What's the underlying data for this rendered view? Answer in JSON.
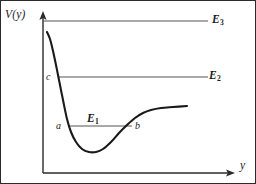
{
  "figure": {
    "axes": {
      "vertical_label": "V(y)",
      "horizontal_label": "y"
    },
    "energy_levels": [
      {
        "name": "E1",
        "label": "E",
        "subscript": "1"
      },
      {
        "name": "E2",
        "label": "E",
        "subscript": "2"
      },
      {
        "name": "E3",
        "label": "E",
        "subscript": "3"
      }
    ],
    "points": [
      {
        "name": "a",
        "label": "a"
      },
      {
        "name": "b",
        "label": "b"
      },
      {
        "name": "c",
        "label": "c"
      }
    ],
    "colors": {
      "curve": "#1a1a1a",
      "axis": "#2b2b2b",
      "level_line": "#555555",
      "frame": "#2b2b2b",
      "background": "#ffffff"
    }
  },
  "chart_data": {
    "type": "line",
    "title": "",
    "xlabel": "y",
    "ylabel": "V(y)",
    "grid": false,
    "legend": null,
    "axis_origin": [
      42,
      172
    ],
    "xlim": [
      42,
      233
    ],
    "ylim": [
      172,
      12
    ],
    "series": [
      {
        "name": "potential-curve",
        "description": "Anharmonic potential well V(y): high repulsive wall at small y, minimum, then asymptotic plateau",
        "points": [
          [
            46,
            31
          ],
          [
            49,
            38
          ],
          [
            52,
            50
          ],
          [
            55,
            64
          ],
          [
            58,
            79
          ],
          [
            62,
            99
          ],
          [
            66,
            118
          ],
          [
            70,
            131
          ],
          [
            75,
            141
          ],
          [
            81,
            148
          ],
          [
            88,
            151
          ],
          [
            95,
            151
          ],
          [
            102,
            148
          ],
          [
            110,
            141
          ],
          [
            118,
            132
          ],
          [
            126,
            124
          ],
          [
            134,
            117
          ],
          [
            142,
            112
          ],
          [
            150,
            109
          ],
          [
            160,
            107
          ],
          [
            172,
            106
          ],
          [
            186,
            105
          ]
        ]
      }
    ],
    "horizontal_levels": [
      {
        "name": "E1",
        "y": 125,
        "x_start": 67,
        "x_end": 131,
        "label_x": 86,
        "label_y": 112
      },
      {
        "name": "E2",
        "y": 76,
        "x_start": 57,
        "x_end": 207,
        "label_x": 208,
        "label_y": 69
      },
      {
        "name": "E3",
        "y": 20,
        "x_start": 42,
        "x_end": 207,
        "label_x": 211,
        "label_y": 13
      }
    ],
    "annotations": [
      {
        "name": "a",
        "x": 67,
        "y": 125,
        "note": "inner turning point on E1"
      },
      {
        "name": "b",
        "x": 131,
        "y": 125,
        "note": "outer turning point on E1"
      },
      {
        "name": "c",
        "x": 57,
        "y": 76,
        "note": "turning point on E2"
      }
    ]
  }
}
